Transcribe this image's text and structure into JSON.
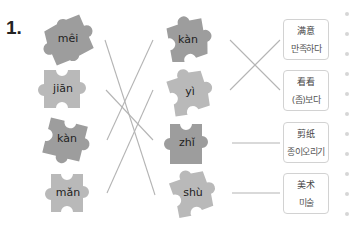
{
  "exercise": {
    "number": "1.",
    "left_pieces": [
      {
        "pinyin": "mêi",
        "shade": "dark"
      },
      {
        "pinyin": "jiān",
        "shade": "light"
      },
      {
        "pinyin": "kàn",
        "shade": "dark"
      },
      {
        "pinyin": "mǎn",
        "shade": "light"
      }
    ],
    "right_pieces": [
      {
        "pinyin": "kàn",
        "shade": "dark"
      },
      {
        "pinyin": "yì",
        "shade": "light"
      },
      {
        "pinyin": "zhǐ",
        "shade": "dark"
      },
      {
        "pinyin": "shù",
        "shade": "light"
      }
    ],
    "cards": [
      {
        "chinese": "满意",
        "korean": "만족하다"
      },
      {
        "chinese": "看看",
        "korean": "(좀)보다"
      },
      {
        "chinese": "剪纸",
        "korean": "종이오리기"
      },
      {
        "chinese": "美术",
        "korean": "미술"
      }
    ]
  },
  "colors": {
    "piece_dark": "#9d9d9d",
    "piece_light": "#b9b9b9",
    "line": "#b4b4b4",
    "card_border": "#d2d2d2"
  }
}
